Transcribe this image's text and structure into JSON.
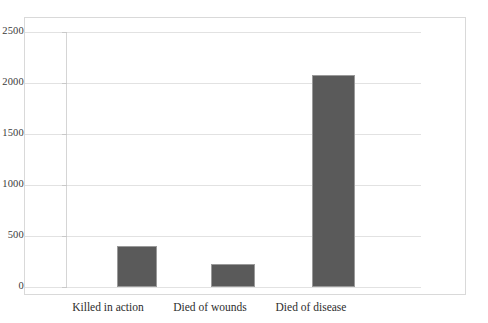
{
  "chart_data": {
    "type": "bar",
    "title": "",
    "subtitle": "",
    "xlabel": "",
    "ylabel": "",
    "categories": [
      "Killed in action",
      "Died of wounds",
      "Died of disease"
    ],
    "values": [
      400,
      225,
      2080
    ],
    "series": [
      {
        "name": "Casualties",
        "values": [
          400,
          225,
          2080
        ]
      }
    ],
    "ylim": [
      0,
      2500
    ],
    "ytick_labels": [
      "0",
      "500",
      "1000",
      "1500",
      "2000",
      "2500"
    ],
    "ytick_values": [
      0,
      500,
      1000,
      1500,
      2000,
      2500
    ],
    "grid": true,
    "grid_axis": "y",
    "legend": false,
    "legend_position": "none",
    "annotations": [],
    "colors": {
      "bar_fill": "#5a5a5a",
      "bar_edge": "#9a9a9a",
      "gridline": "#e2e2e2",
      "axis_line": "#d5d5d5",
      "frame_border": "#d9d9d9",
      "tick_label": "#3a3a3a",
      "category_label": "#2d2d2d",
      "background": "#ffffff"
    }
  }
}
